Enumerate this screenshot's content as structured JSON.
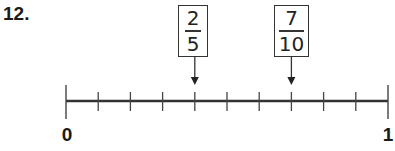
{
  "question_number": "12.",
  "number_line": {
    "start_label": "0",
    "end_label": "1",
    "divisions": 10,
    "line_color": "#333333"
  },
  "markers": [
    {
      "numerator": "2",
      "denominator": "5",
      "points_to_tick": 4
    },
    {
      "numerator": "7",
      "denominator": "10",
      "points_to_tick": 7
    }
  ]
}
